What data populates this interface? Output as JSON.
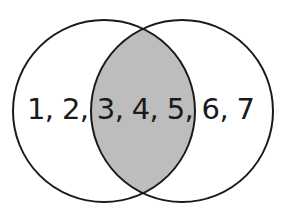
{
  "diagram": {
    "type": "venn",
    "sets": [
      {
        "name": "left-set",
        "members_only": [
          "1",
          "2"
        ]
      },
      {
        "name": "right-set",
        "members_only": [
          "6",
          "7"
        ]
      }
    ],
    "intersection": [
      "3",
      "4",
      "5"
    ],
    "label_text": "1, 2, 3, 4, 5, 6, 7",
    "colors": {
      "outline": "#1a1a1a",
      "intersection_fill": "#bdbdbd",
      "background": "#ffffff"
    }
  }
}
